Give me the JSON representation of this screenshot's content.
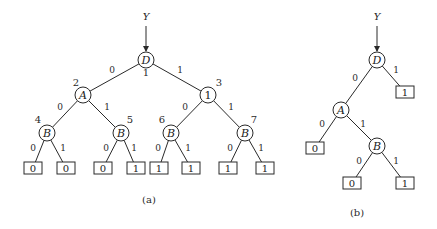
{
  "figure": {
    "diagrams": [
      {
        "id": "a",
        "caption": "(a)",
        "caption_pos": [
          149,
          203
        ],
        "input": {
          "label": "Y",
          "pos": [
            146,
            20
          ],
          "arrow_from": [
            146,
            26
          ],
          "arrow_to": [
            146,
            51
          ]
        },
        "nodes": [
          {
            "id": "D1",
            "label": "D",
            "italic": true,
            "index": "1",
            "x": 146,
            "y": 60,
            "index_pos": [
              146,
              76
            ]
          },
          {
            "id": "A2",
            "label": "A",
            "italic": true,
            "index": "2",
            "x": 83,
            "y": 95,
            "index_pos": [
              76,
              86
            ]
          },
          {
            "id": "N3",
            "label": "1",
            "italic": false,
            "index": "3",
            "x": 208,
            "y": 95,
            "index_pos": [
              219,
              86
            ]
          },
          {
            "id": "B4",
            "label": "B",
            "italic": true,
            "index": "4",
            "x": 47,
            "y": 133,
            "index_pos": [
              38,
              123
            ]
          },
          {
            "id": "B5",
            "label": "B",
            "italic": true,
            "index": "5",
            "x": 121,
            "y": 133,
            "index_pos": [
              130,
              123
            ]
          },
          {
            "id": "B6",
            "label": "B",
            "italic": true,
            "index": "6",
            "x": 171,
            "y": 133,
            "index_pos": [
              162,
              123
            ]
          },
          {
            "id": "B7",
            "label": "B",
            "italic": true,
            "index": "7",
            "x": 245,
            "y": 133,
            "index_pos": [
              254,
              123
            ]
          }
        ],
        "leaves": [
          {
            "id": "L1",
            "value": "0",
            "x": 33,
            "y": 168
          },
          {
            "id": "L2",
            "value": "0",
            "x": 66,
            "y": 168
          },
          {
            "id": "L3",
            "value": "0",
            "x": 103,
            "y": 168
          },
          {
            "id": "L4",
            "value": "1",
            "x": 136,
            "y": 168
          },
          {
            "id": "L5",
            "value": "1",
            "x": 159,
            "y": 168
          },
          {
            "id": "L6",
            "value": "1",
            "x": 191,
            "y": 168
          },
          {
            "id": "L7",
            "value": "1",
            "x": 228,
            "y": 168
          },
          {
            "id": "L8",
            "value": "1",
            "x": 265,
            "y": 168
          }
        ],
        "edges": [
          {
            "from": "D1",
            "to": "A2",
            "label": "0",
            "label_pos": [
              112,
              73
            ]
          },
          {
            "from": "D1",
            "to": "N3",
            "label": "1",
            "label_pos": [
              180,
              73
            ]
          },
          {
            "from": "A2",
            "to": "B4",
            "label": "0",
            "label_pos": [
              60,
              110
            ]
          },
          {
            "from": "A2",
            "to": "B5",
            "label": "1",
            "label_pos": [
              107,
              110
            ]
          },
          {
            "from": "N3",
            "to": "B6",
            "label": "0",
            "label_pos": [
              185,
              110
            ]
          },
          {
            "from": "N3",
            "to": "B7",
            "label": "1",
            "label_pos": [
              231,
              110
            ]
          },
          {
            "from": "B4",
            "to": "L1",
            "label": "0",
            "label_pos": [
              33,
              151
            ]
          },
          {
            "from": "B4",
            "to": "L2",
            "label": "1",
            "label_pos": [
              63,
              151
            ]
          },
          {
            "from": "B5",
            "to": "L3",
            "label": "0",
            "label_pos": [
              106,
              151
            ]
          },
          {
            "from": "B5",
            "to": "L4",
            "label": "1",
            "label_pos": [
              134,
              151
            ]
          },
          {
            "from": "B6",
            "to": "L5",
            "label": "0",
            "label_pos": [
              158,
              151
            ]
          },
          {
            "from": "B6",
            "to": "L6",
            "label": "1",
            "label_pos": [
              188,
              151
            ]
          },
          {
            "from": "B7",
            "to": "L7",
            "label": "0",
            "label_pos": [
              230,
              151
            ]
          },
          {
            "from": "B7",
            "to": "L8",
            "label": "1",
            "label_pos": [
              261,
              151
            ]
          }
        ]
      },
      {
        "id": "b",
        "caption": "(b)",
        "caption_pos": [
          357,
          216
        ],
        "input": {
          "label": "Y",
          "pos": [
            377,
            20
          ],
          "arrow_from": [
            377,
            26
          ],
          "arrow_to": [
            377,
            51
          ]
        },
        "nodes": [
          {
            "id": "D",
            "label": "D",
            "italic": true,
            "index": "",
            "x": 377,
            "y": 60
          },
          {
            "id": "A",
            "label": "A",
            "italic": true,
            "index": "",
            "x": 341,
            "y": 110
          },
          {
            "id": "B",
            "label": "B",
            "italic": true,
            "index": "",
            "x": 377,
            "y": 146
          }
        ],
        "leaves": [
          {
            "id": "LD1",
            "value": "1",
            "x": 405,
            "y": 92
          },
          {
            "id": "LA0",
            "value": "0",
            "x": 315,
            "y": 148
          },
          {
            "id": "LB0",
            "value": "0",
            "x": 352,
            "y": 183
          },
          {
            "id": "LB1",
            "value": "1",
            "x": 405,
            "y": 183
          }
        ],
        "edges": [
          {
            "from": "D",
            "to": "A",
            "label": "0",
            "label_pos": [
              355,
              81
            ]
          },
          {
            "from": "D",
            "to": "LD1",
            "label": "1",
            "label_pos": [
              396,
              73
            ]
          },
          {
            "from": "A",
            "to": "LA0",
            "label": "0",
            "label_pos": [
              322,
              127
            ]
          },
          {
            "from": "A",
            "to": "B",
            "label": "1",
            "label_pos": [
              363,
              127
            ]
          },
          {
            "from": "B",
            "to": "LB0",
            "label": "0",
            "label_pos": [
              359,
              164
            ]
          },
          {
            "from": "B",
            "to": "LB1",
            "label": "1",
            "label_pos": [
              396,
              164
            ]
          }
        ]
      }
    ],
    "style": {
      "stroke": "#2a2a2a",
      "node_radius": 8,
      "leaf_width": 18,
      "leaf_height": 12
    }
  }
}
